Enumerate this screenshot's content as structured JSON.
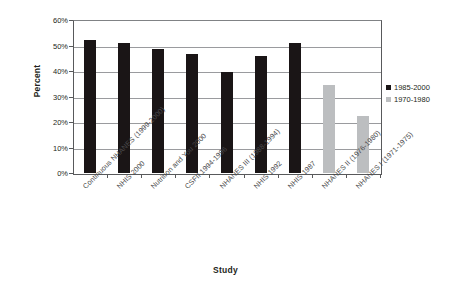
{
  "chart_data": {
    "type": "bar",
    "title": "",
    "xlabel": "Study",
    "ylabel": "Percent",
    "ylim": [
      0,
      60
    ],
    "ytick_labels": [
      "0%",
      "10%",
      "20%",
      "30%",
      "40%",
      "50%",
      "60%"
    ],
    "ytick_values": [
      0,
      10,
      20,
      30,
      40,
      50,
      60
    ],
    "grid": true,
    "legend_position": "right",
    "categories": [
      "Continuous NHANES (1999-2000)",
      "NHIS 2000",
      "Nutrition and You 2000",
      "CSFII 1994-1996",
      "NHANES III (1988-1994)",
      "NHIS 1992",
      "NHIS 1987",
      "NHANES II (1976-1980)",
      "NHANES I (1971-1975)"
    ],
    "series": [
      {
        "name": "1985-2000",
        "color": "#1a1516",
        "values": [
          52.0,
          51.0,
          48.7,
          46.8,
          39.8,
          46.0,
          51.0,
          null,
          null
        ]
      },
      {
        "name": "1970-1980",
        "color": "#bcbec0",
        "values": [
          null,
          null,
          null,
          null,
          null,
          null,
          null,
          34.5,
          22.5
        ]
      }
    ]
  },
  "legend": {
    "entries": [
      {
        "label": "1985-2000",
        "color": "#1a1516"
      },
      {
        "label": "1970-1980",
        "color": "#bcbec0"
      }
    ]
  }
}
